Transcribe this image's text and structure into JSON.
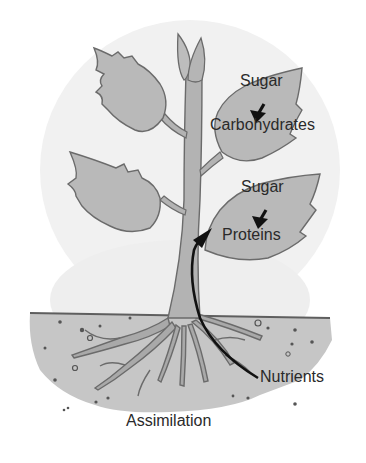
{
  "diagram": {
    "title": "Assimilation",
    "colors": {
      "background": "#ffffff",
      "wash": "#ececec",
      "leaf_fill": "#b9b9b9",
      "stem_fill": "#b3b3b3",
      "outline": "#6b6b6b",
      "soil_fill": "#c6c6c6",
      "arrow": "#111111",
      "text": "#2a2a2a"
    },
    "labels": {
      "upper_leaf_input": "Sugar",
      "upper_leaf_output": "Carbohydrates",
      "lower_leaf_input": "Sugar",
      "lower_leaf_output": "Proteins",
      "soil_input": "Nutrients",
      "caption": "Assimilation"
    },
    "flows": [
      {
        "from": "Sugar",
        "to": "Carbohydrates",
        "location": "upper right leaf"
      },
      {
        "from": "Sugar",
        "to": "Proteins",
        "location": "lower right leaf"
      },
      {
        "from": "Nutrients",
        "to": "Proteins",
        "location": "roots up through stem"
      }
    ],
    "parts": [
      "bud",
      "upper left leaf",
      "lower left leaf",
      "upper right leaf",
      "lower right leaf",
      "stem",
      "soil",
      "roots"
    ]
  }
}
